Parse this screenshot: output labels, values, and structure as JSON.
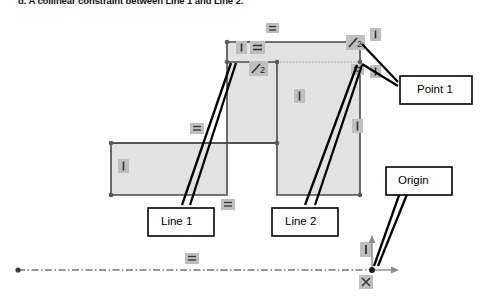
{
  "caption": "d.  A collinear constraint between Line 1 and Line 2.",
  "colors": {
    "shape_fill": "#e2e2e2",
    "shape_stroke": "#4a4a4a",
    "badge_fill": "#bfbfbf",
    "badge_glyph": "#333333",
    "callout_stroke": "#000000",
    "callout_fill": "#ffffff",
    "construction_line": "#333333",
    "vertex": "#555555",
    "axis_arrow": "#888888",
    "background": "#ffffff"
  },
  "callouts": [
    {
      "id": "point-1",
      "label": "Point 1"
    },
    {
      "id": "line-1",
      "label": "Line 1"
    },
    {
      "id": "line-2",
      "label": "Line 2"
    },
    {
      "id": "origin",
      "label": "Origin"
    }
  ],
  "constraints": [
    {
      "id": "c-top-horizontal",
      "type": "horizontal-constraint",
      "glyph": "=",
      "x": 272,
      "y": 28
    },
    {
      "id": "c-topleft-vertical",
      "type": "vertical-constraint",
      "glyph": "|",
      "x": 241,
      "y": 46
    },
    {
      "id": "c-topleft-horizontal",
      "type": "horizontal-constraint",
      "glyph": "=",
      "x": 258,
      "y": 46
    },
    {
      "id": "c-topright-vertical",
      "type": "vertical-constraint",
      "glyph": "|",
      "x": 375,
      "y": 33
    },
    {
      "id": "c-collinear-right",
      "type": "collinear-constraint",
      "glyph": "/2",
      "x": 353,
      "y": 41
    },
    {
      "id": "c-collinear-left",
      "type": "collinear-constraint",
      "glyph": "/2",
      "x": 256,
      "y": 67
    },
    {
      "id": "c-mid-horizontal",
      "type": "horizontal-constraint",
      "glyph": "=",
      "x": 357,
      "y": 69
    },
    {
      "id": "c-right-vertical-upper",
      "type": "vertical-constraint",
      "glyph": "|",
      "x": 375,
      "y": 71
    },
    {
      "id": "c-center-vertical",
      "type": "vertical-constraint",
      "glyph": "|",
      "x": 299,
      "y": 96
    },
    {
      "id": "c-right-vertical-lower",
      "type": "vertical-constraint",
      "glyph": "|",
      "x": 357,
      "y": 126
    },
    {
      "id": "c-left-horizontal",
      "type": "horizontal-constraint",
      "glyph": "=",
      "x": 197,
      "y": 128
    },
    {
      "id": "c-leftrect-vertical",
      "type": "vertical-constraint",
      "glyph": "|",
      "x": 123,
      "y": 166
    },
    {
      "id": "c-bottom-horizontal",
      "type": "horizontal-constraint",
      "glyph": "=",
      "x": 228,
      "y": 204
    },
    {
      "id": "c-origin-vertical",
      "type": "vertical-constraint",
      "glyph": "|",
      "x": 366,
      "y": 249
    },
    {
      "id": "c-origin-fix",
      "type": "fix-constraint",
      "glyph": "x",
      "x": 366,
      "y": 282
    },
    {
      "id": "c-axis-horizontal",
      "type": "horizontal-constraint",
      "glyph": "=",
      "x": 192,
      "y": 258
    }
  ],
  "geometry": {
    "shape_name": "sketch-profile",
    "outline_points": "227,42 360,42 360,195 277,195 277,143 111,143 111,195 227,195",
    "inner_points": "227,62 277,62 277,143 111,143",
    "vertices": [
      [
        227,
        42
      ],
      [
        360,
        42
      ],
      [
        360,
        62
      ],
      [
        360,
        195
      ],
      [
        277,
        195
      ],
      [
        277,
        143
      ],
      [
        277,
        62
      ],
      [
        227,
        62
      ],
      [
        111,
        143
      ],
      [
        111,
        195
      ],
      [
        227,
        195
      ]
    ],
    "construction_line": {
      "x1": 18,
      "y1": 270,
      "x2": 372,
      "y2": 270
    },
    "origin": {
      "x": 372,
      "y": 270
    }
  },
  "axes": {
    "y_arrow": {
      "x": 372,
      "y_top": 238,
      "y_bottom": 270
    },
    "x_arrow": {
      "y": 270,
      "x_left": 372,
      "x_right": 398
    }
  }
}
